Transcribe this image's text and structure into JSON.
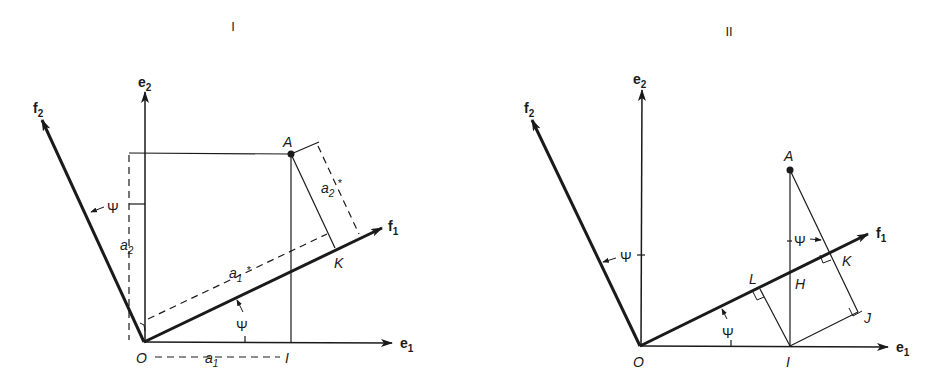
{
  "panels": [
    {
      "id": "I",
      "title": "I",
      "labels": {
        "e1": "e",
        "e1_sub": "1",
        "e2": "e",
        "e2_sub": "2",
        "f1": "f",
        "f1_sub": "1",
        "f2": "f",
        "f2_sub": "2",
        "point_A": "A",
        "point_O": "O",
        "point_I": "I",
        "point_K": "K",
        "a1": "a",
        "a1_sub": "1",
        "a2": "a",
        "a2_sub": "2",
        "a1_star": "a",
        "a1_star_sub": "1",
        "a1_star_mark": "*",
        "a2_star": "a",
        "a2_star_sub": "2",
        "a2_star_mark": "*",
        "psi_bottom": "Ψ",
        "psi_left": "Ψ"
      }
    },
    {
      "id": "II",
      "title": "II",
      "labels": {
        "e1": "e",
        "e1_sub": "1",
        "e2": "e",
        "e2_sub": "2",
        "f1": "f",
        "f1_sub": "1",
        "f2": "f",
        "f2_sub": "2",
        "point_A": "A",
        "point_O": "O",
        "point_I": "I",
        "point_K": "K",
        "point_L": "L",
        "point_H": "H",
        "point_J": "J",
        "psi_bottom": "Ψ",
        "psi_left": "Ψ",
        "psi_top": "Ψ"
      }
    }
  ],
  "colors": {
    "ink": "#1a1a1a",
    "background": "#ffffff"
  }
}
